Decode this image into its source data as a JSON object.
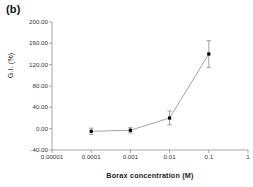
{
  "figure": {
    "panel_label": "(b)"
  },
  "chart_data": {
    "type": "line",
    "title": "",
    "xlabel": "Borax concentration (M)",
    "ylabel": "G.I. (%)",
    "xscale": "log",
    "xlim": [
      1e-05,
      1
    ],
    "ylim": [
      -40,
      200
    ],
    "grid": false,
    "legend": null,
    "xticks": [
      1e-05,
      0.0001,
      0.001,
      0.01,
      0.1,
      1
    ],
    "xtick_labels": [
      "0.00001",
      "0.0001",
      "0.001",
      "0.01",
      "0.1",
      "1"
    ],
    "yticks": [
      -40,
      0,
      40,
      80,
      120,
      160,
      200
    ],
    "ytick_labels": [
      "-40.00",
      "0.00",
      "40.00",
      "80.00",
      "120.00",
      "160.00",
      "200.00"
    ],
    "series": [
      {
        "name": "G.I.",
        "marker": "square",
        "color": "#000000",
        "line_color": "#9a9a9a",
        "x": [
          0.0001,
          0.001,
          0.01,
          0.1
        ],
        "values": [
          -5.0,
          -3.0,
          20.0,
          140.0
        ],
        "yerr": [
          6.0,
          5.0,
          13.0,
          25.0
        ]
      }
    ]
  }
}
